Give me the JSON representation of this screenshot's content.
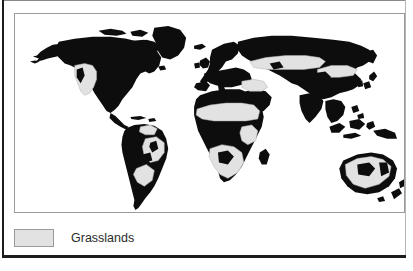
{
  "figure": {
    "type": "thematic-world-map",
    "title": "",
    "map_alt": "World map with grassland regions shaded"
  },
  "colors": {
    "land": "#0d0d0d",
    "grassland": "#e2e2e2",
    "grassland_stroke": "#9a9a9a",
    "ocean": "#ffffff",
    "panel_border": "#9b9b9b",
    "outer_rule": "#1c1c1c",
    "label_text": "#2b2b2b"
  },
  "legend": {
    "items": [
      {
        "label": "Grasslands",
        "swatch_color": "#e2e2e2",
        "swatch_border": "#9a9a9a"
      }
    ]
  },
  "map_regions": {
    "landmasses": [
      "North America",
      "Greenland",
      "South America",
      "Europe",
      "Africa",
      "Asia",
      "Australia",
      "New Zealand",
      "Madagascar",
      "Japan",
      "British Isles",
      "Indonesia",
      "Philippines",
      "Iceland"
    ],
    "grassland_areas": [
      "Great Plains / Prairie (North America)",
      "Cerrado (Brazil)",
      "Pampas (Argentina / Uruguay)",
      "Llanos (Venezuela)",
      "Sahel (Africa)",
      "East African savanna",
      "Southern African veld / Kalahari",
      "Eurasian steppe (Ukraine to Kazakhstan)",
      "Mongolian steppe",
      "Anatolian / Iranian plateau",
      "Australian rangelands"
    ]
  }
}
